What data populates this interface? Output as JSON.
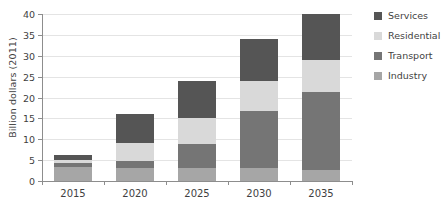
{
  "chart_data": {
    "type": "bar",
    "stacked": true,
    "title": "",
    "xlabel": "",
    "ylabel": "Billion dollars (2011)",
    "categories": [
      "2015",
      "2020",
      "2025",
      "2030",
      "2035"
    ],
    "ylim": [
      0,
      40
    ],
    "yticks": [
      0,
      5,
      10,
      15,
      20,
      25,
      30,
      35,
      40
    ],
    "grid": true,
    "legend_position": "right",
    "series": [
      {
        "name": "Industry",
        "color": "#a6a6a6",
        "values": [
          3.4,
          3.0,
          3.0,
          3.0,
          2.6
        ]
      },
      {
        "name": "Transport",
        "color": "#757575",
        "values": [
          1.0,
          1.8,
          5.9,
          13.8,
          18.7
        ]
      },
      {
        "name": "Residential",
        "color": "#d9d9d9",
        "values": [
          0.7,
          4.2,
          6.1,
          7.1,
          7.8
        ]
      },
      {
        "name": "Services",
        "color": "#555555",
        "values": [
          1.1,
          7.0,
          9.0,
          10.1,
          10.9
        ]
      }
    ],
    "totals": [
      6.2,
      16.0,
      24.0,
      34.0,
      40.0
    ],
    "legend_order": [
      "Services",
      "Residential",
      "Transport",
      "Industry"
    ]
  },
  "style": {
    "gridline_color": "#e4e4e4",
    "axis_color": "#8d8d8d",
    "text_color": "#3f3f3f",
    "background": "#ffffff"
  }
}
